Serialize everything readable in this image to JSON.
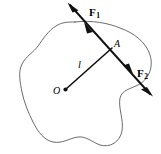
{
  "figure": {
    "type": "mechanics-free-body-diagram",
    "background_color": "#ffffff",
    "outline_color": "#5a5a5a",
    "vector_color": "#111111",
    "labels": {
      "force_1": "F",
      "force_1_sub": "1",
      "force_2": "F",
      "force_2_sub": "2",
      "point_a": "A",
      "lever_arm": "l",
      "origin": "O"
    },
    "geometry": {
      "point_o": {
        "x": 65,
        "y": 90
      },
      "point_a": {
        "x": 110,
        "y": 50
      },
      "force_line_start": {
        "x": 68,
        "y": 3
      },
      "force_line_end": {
        "x": 152,
        "y": 96
      }
    }
  }
}
